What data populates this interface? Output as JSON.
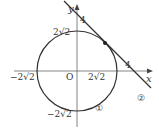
{
  "diagram": {
    "type": "coordinate-plane",
    "axes": {
      "x_label": "x",
      "y_label": "y",
      "origin_label": "O"
    },
    "labels": {
      "y_top_circle": "2√2",
      "y_bottom_circle": "−2√2",
      "x_left_circle": "−2√2",
      "x_right_circle": "2√2",
      "y_intercept_line": "4",
      "x_intercept_line": "4",
      "circle_marker": "①",
      "line_marker": "②"
    },
    "circle": {
      "center": [
        0,
        0
      ],
      "radius": "2√2",
      "label": "①"
    },
    "line": {
      "x_intercept": 4,
      "y_intercept": 4,
      "label": "②"
    },
    "tangent_point": [
      2,
      2
    ],
    "colors": {
      "stroke": "#333333",
      "axis": "#555555"
    }
  }
}
